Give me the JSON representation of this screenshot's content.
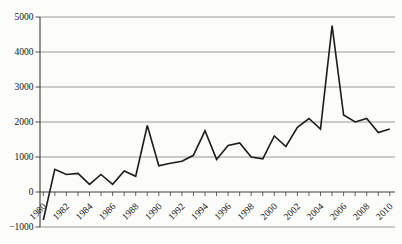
{
  "figure": {
    "background": "#fcfcfa",
    "axis_color": "#3c3c3c",
    "grid_color": "#8f8f8f",
    "line_color": "#1c1c1c",
    "text_color": "#151515"
  },
  "chart_data": {
    "type": "line",
    "title": "",
    "xlabel": "",
    "ylabel": "",
    "x": [
      1980,
      1981,
      1982,
      1983,
      1984,
      1985,
      1986,
      1987,
      1988,
      1989,
      1990,
      1991,
      1992,
      1993,
      1994,
      1995,
      1996,
      1997,
      1998,
      1999,
      2000,
      2001,
      2002,
      2003,
      2004,
      2005,
      2006,
      2007,
      2008,
      2009,
      2010
    ],
    "values": [
      -800,
      650,
      500,
      530,
      220,
      500,
      220,
      600,
      450,
      1900,
      750,
      820,
      880,
      1050,
      1750,
      930,
      1330,
      1400,
      1000,
      950,
      1600,
      1300,
      1850,
      2100,
      1800,
      4750,
      2200,
      2000,
      2100,
      1700,
      1800
    ],
    "ylim": [
      -1000,
      5000
    ],
    "yticks": [
      5000,
      4000,
      3000,
      2000,
      1000,
      0,
      -1000
    ],
    "ytick_labels": [
      "5000",
      "4000",
      "3000",
      "2000",
      "1000",
      "0",
      "−1000"
    ],
    "xtick_label_years": [
      1980,
      1982,
      1984,
      1986,
      1988,
      1990,
      1992,
      1994,
      1996,
      1998,
      2000,
      2002,
      2004,
      2006,
      2008,
      2010
    ],
    "grid": "horizontal",
    "legend": "none",
    "series_name": "annual-value-series"
  }
}
